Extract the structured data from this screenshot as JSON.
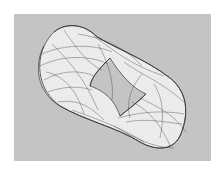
{
  "image": {
    "subject": "strange attractor ring",
    "description": "A rotated, ring-shaped chaotic attractor rendered as dense grey line-work on a light-grey panel with a diamond-shaped hole in the center",
    "colors": {
      "page_background": "#ffffff",
      "panel_background": "#c4c4c4",
      "fill": "#f4f4f4",
      "strokes": "#3a3a3a"
    }
  }
}
